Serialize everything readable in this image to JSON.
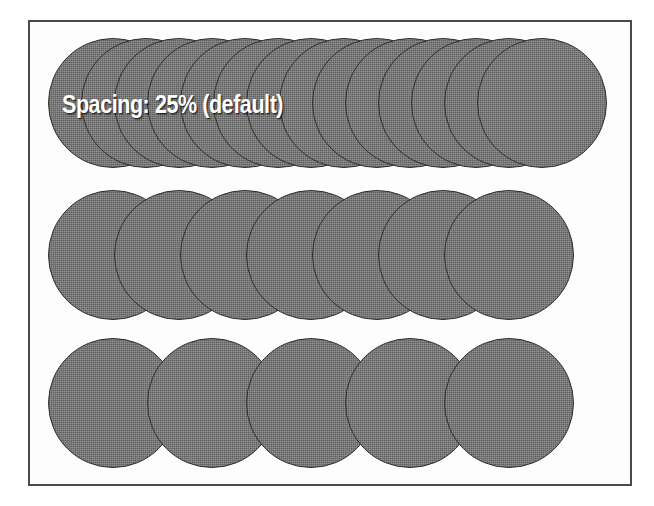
{
  "figure": {
    "width": 654,
    "height": 506,
    "background_color": "#ffffff",
    "frame": {
      "border_color": "#4a4a4a",
      "fill_color": "#fdfdfd",
      "x": 28,
      "y": 20,
      "width": 604,
      "height": 466
    },
    "dab": {
      "fill_color": "#777777",
      "outline_color": "#2e2e2e",
      "label_color": "#ffffff",
      "diameter": 130
    }
  },
  "rows": [
    {
      "id": "row-spacing-25",
      "label": "Spacing: 25% (default)",
      "spacing_percent": 25,
      "dab_count": 14,
      "dab_diameter": 130,
      "step": 33,
      "start_x": 48,
      "top_y": 38,
      "label_x": 62,
      "label_y": 92
    },
    {
      "id": "row-spacing-50",
      "label": "Spacing: 50%",
      "spacing_percent": 50,
      "dab_count": 7,
      "dab_diameter": 130,
      "step": 66,
      "start_x": 48,
      "top_y": 190,
      "label_x": 62,
      "label_y": 243
    },
    {
      "id": "row-spacing-75",
      "label": "Spacing: 75%",
      "spacing_percent": 75,
      "dab_count": 5,
      "dab_diameter": 130,
      "step": 99,
      "start_x": 48,
      "top_y": 338,
      "label_x": 62,
      "label_y": 390
    }
  ]
}
